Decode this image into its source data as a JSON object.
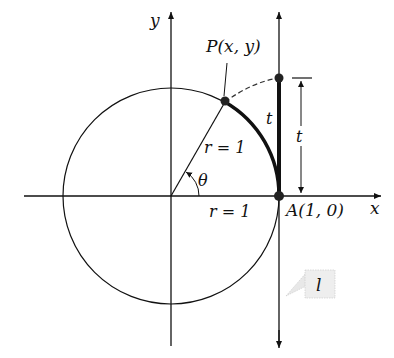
{
  "figure": {
    "labels": {
      "y_axis": "y",
      "x_axis": "x",
      "point_p": "P(x, y)",
      "point_a": "A(1, 0)",
      "radius_slanted": "r = 1",
      "radius_horizontal": "r = 1",
      "angle": "θ",
      "arc_length": "t",
      "segment_length": "t",
      "tangent_line": "l"
    },
    "colors": {
      "stroke": "#111111",
      "callout_bg": "#eeeeee",
      "callout_border": "#bbbbbb"
    }
  }
}
